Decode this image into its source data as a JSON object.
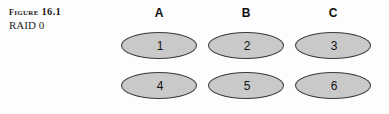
{
  "figure": {
    "label": "Figure 16.1",
    "subtitle": "RAID 0"
  },
  "diagram": {
    "columns": [
      {
        "header": "A"
      },
      {
        "header": "B"
      },
      {
        "header": "C"
      }
    ],
    "rows": [
      {
        "cells": [
          {
            "value": "1"
          },
          {
            "value": "2"
          },
          {
            "value": "3"
          }
        ]
      },
      {
        "cells": [
          {
            "value": "4"
          },
          {
            "value": "5"
          },
          {
            "value": "6"
          }
        ]
      }
    ],
    "colors": {
      "ellipse_fill": "#c9c9c9",
      "ellipse_stroke": "#3a3a3a",
      "background": "#fdfdfd",
      "text": "#141414"
    }
  }
}
